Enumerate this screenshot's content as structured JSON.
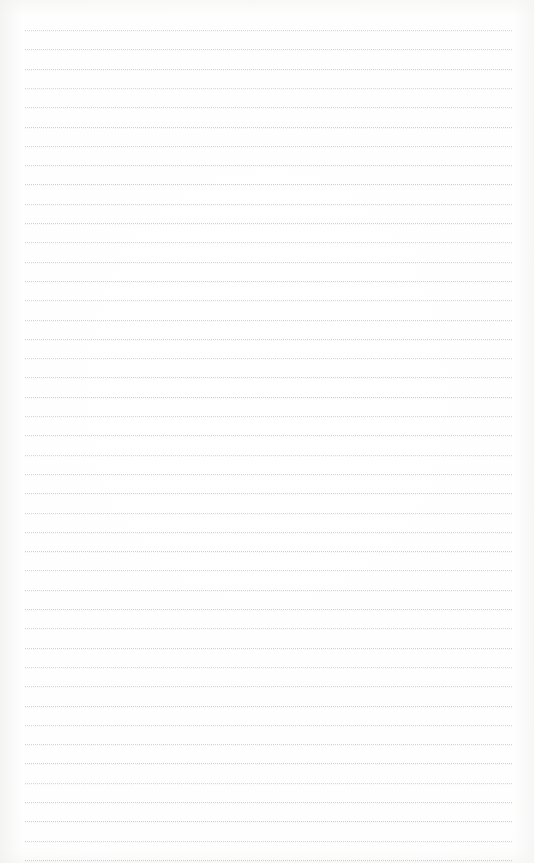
{
  "document": {
    "kind": "scanned-blank-ruled-page",
    "page_width": 534,
    "page_height": 863,
    "background_color": "#fefefe",
    "has_visible_text": false,
    "text_content": "",
    "header_text": "",
    "footer_text": "",
    "page_number_text": ""
  },
  "ruling": {
    "line_color": "#b0b4c0",
    "line_style": "dotted",
    "line_count": 44,
    "first_line_y": 30,
    "line_spacing": 19.3,
    "left_edge_x": 25,
    "right_edge_x": 512,
    "line_thickness": 1
  },
  "margins": {
    "left": 25,
    "right": 22,
    "top": 30,
    "bottom": 3
  }
}
